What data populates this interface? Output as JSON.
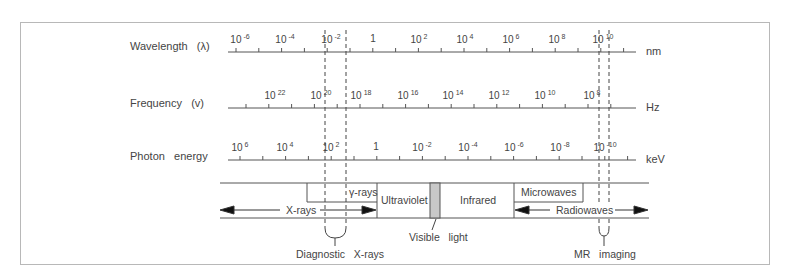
{
  "diagram": {
    "rows": [
      {
        "label": "Wavelength   (λ)",
        "unit": "nm",
        "ticks": [
          {
            "base": "10",
            "exp": "-6",
            "x": 240
          },
          {
            "base": "10",
            "exp": "-4",
            "x": 285
          },
          {
            "base": "10",
            "exp": "-2",
            "x": 331
          },
          {
            "base": "1",
            "exp": "",
            "x": 373
          },
          {
            "base": "10",
            "exp": "2",
            "x": 419
          },
          {
            "base": "10",
            "exp": "4",
            "x": 465
          },
          {
            "base": "10",
            "exp": "6",
            "x": 511
          },
          {
            "base": "10",
            "exp": "8",
            "x": 557
          },
          {
            "base": "10",
            "exp": "10",
            "x": 603
          }
        ]
      },
      {
        "label": "Frequency   (v)",
        "unit": "Hz",
        "ticks": [
          {
            "base": "10",
            "exp": "22",
            "x": 275
          },
          {
            "base": "10",
            "exp": "20",
            "x": 321
          },
          {
            "base": "10",
            "exp": "18",
            "x": 361
          },
          {
            "base": "10",
            "exp": "16",
            "x": 408
          },
          {
            "base": "10",
            "exp": "14",
            "x": 453
          },
          {
            "base": "10",
            "exp": "12",
            "x": 499
          },
          {
            "base": "10",
            "exp": "10",
            "x": 545
          },
          {
            "base": "10",
            "exp": "8",
            "x": 592
          }
        ]
      },
      {
        "label": "Photon   energy",
        "unit": "keV",
        "ticks": [
          {
            "base": "10",
            "exp": "6",
            "x": 240
          },
          {
            "base": "10",
            "exp": "4",
            "x": 285
          },
          {
            "base": "10",
            "exp": "2",
            "x": 331
          },
          {
            "base": "1",
            "exp": "",
            "x": 376
          },
          {
            "base": "10",
            "exp": "-2",
            "x": 422
          },
          {
            "base": "10",
            "exp": "-4",
            "x": 468
          },
          {
            "base": "10",
            "exp": "-6",
            "x": 514
          },
          {
            "base": "10",
            "exp": "-8",
            "x": 560
          },
          {
            "base": "10",
            "exp": "-10",
            "x": 605
          }
        ]
      }
    ],
    "bands": {
      "gamma_rays": "γ-rays",
      "x_rays": "X-rays",
      "ultraviolet": "Ultraviolet",
      "infrared": "Infrared",
      "microwaves": "Microwaves",
      "radiowaves": "Radiowaves"
    },
    "annotations": {
      "diagnostic_xrays": "Diagnostic   X-rays",
      "visible_light": "Visible   light",
      "mr_imaging": "MR   imaging"
    },
    "colors": {
      "line": "#555555",
      "frame": "#b8b8b8",
      "visible_fill": "#c8c8c8"
    }
  }
}
